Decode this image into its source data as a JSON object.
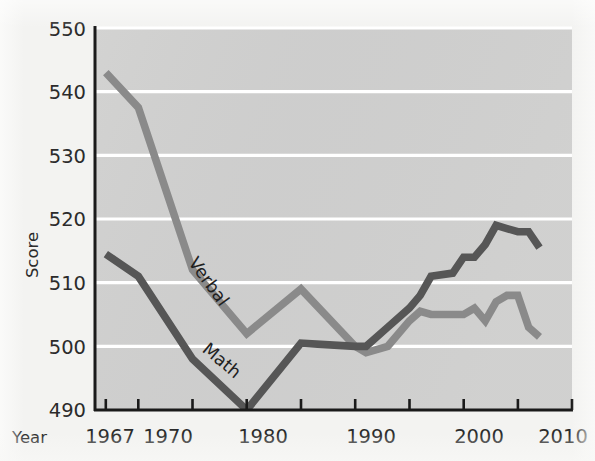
{
  "figure": {
    "background_color": "#f2f2f0",
    "plot_background_color": "#cfcfcf",
    "gridline_color": "#ffffff",
    "axis_color": "#1a1a1a"
  },
  "axes": {
    "y": {
      "title": "Score",
      "ticks": [
        490,
        500,
        510,
        520,
        530,
        540,
        550
      ],
      "tick_labels": [
        "490",
        "500",
        "510",
        "520",
        "530",
        "540",
        "550"
      ],
      "range": [
        490,
        550
      ]
    },
    "x": {
      "title": "Year",
      "tick_labels": [
        "1967",
        "1970",
        "1980",
        "1990",
        "2000",
        "2010"
      ],
      "tick_values": [
        1967,
        1970,
        1975,
        1980,
        1985,
        1990,
        1995,
        2000,
        2005,
        2010
      ],
      "labeled_ticks": [
        1967,
        1970,
        1980,
        1990,
        2000,
        2010
      ],
      "range": [
        1966,
        2010
      ]
    }
  },
  "series_labels": {
    "verbal": "Verbal",
    "math": "Math"
  },
  "colors": {
    "verbal_line": "#8a8a8a",
    "math_line": "#565656"
  },
  "chart_data": {
    "type": "line",
    "title": "",
    "xlabel": "Year",
    "ylabel": "Score",
    "xlim": [
      1966,
      2010
    ],
    "ylim": [
      490,
      550
    ],
    "grid": true,
    "legend_position": "inline-labels",
    "series": [
      {
        "name": "Verbal",
        "color": "#8a8a8a",
        "x": [
          1967,
          1970,
          1975,
          1980,
          1985,
          1990,
          1991,
          1993,
          1995,
          1996,
          1997,
          1999,
          2000,
          2001,
          2002,
          2003,
          2004,
          2005,
          2006,
          2007
        ],
        "values": [
          543,
          537.5,
          512,
          502,
          509,
          500,
          499,
          500,
          504,
          505.5,
          505,
          505,
          505,
          506,
          504,
          507,
          508,
          508,
          503,
          501.5
        ]
      },
      {
        "name": "Math",
        "color": "#565656",
        "x": [
          1967,
          1970,
          1975,
          1980,
          1985,
          1990,
          1991,
          1993,
          1995,
          1996,
          1997,
          1999,
          2000,
          2001,
          2002,
          2003,
          2004,
          2005,
          2006,
          2007
        ],
        "values": [
          514.5,
          511,
          498,
          490,
          500.5,
          500,
          500,
          503,
          506,
          508,
          511,
          511.5,
          514,
          514,
          516,
          519,
          518.5,
          518,
          518,
          515.5
        ]
      }
    ]
  }
}
